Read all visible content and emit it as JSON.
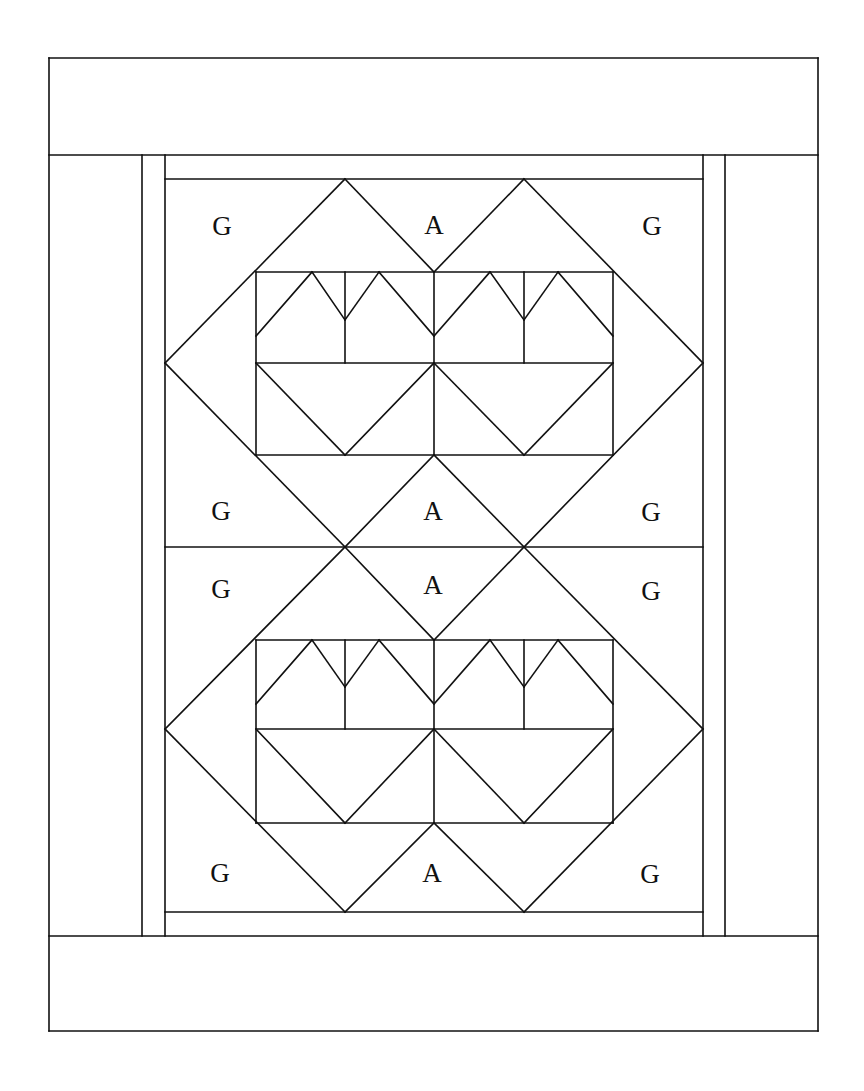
{
  "diagram": {
    "type": "quilt-block-layout",
    "stroke_color": "#111111",
    "background": "#ffffff",
    "outer_frame": {
      "x1": 49,
      "y1": 58,
      "x2": 818,
      "y2": 1031
    },
    "top_border": {
      "y": 155
    },
    "bottom_border": {
      "y": 936
    },
    "sashing": {
      "left_outer_x": 142,
      "left_inner_x": 165,
      "right_inner_x": 703,
      "right_outer_x": 725
    },
    "center_block": {
      "x1": 165,
      "y1": 179,
      "x2": 703,
      "y2": 912,
      "divider_y": 547
    },
    "hearts_blocks": [
      {
        "top": 179,
        "rect_top": 272,
        "mid": 363,
        "rect_bottom": 455,
        "bottom": 547,
        "v_bottom": 320,
        "inner_v": 336
      },
      {
        "top": 547,
        "rect_top": 640,
        "mid": 729,
        "rect_bottom": 823,
        "bottom": 912,
        "v_bottom": 687,
        "inner_v": 704
      }
    ],
    "columns": {
      "left": 165,
      "rect_left": 256,
      "peak_l1": 312,
      "heart1_center": 345,
      "peak_l2": 379,
      "center": 434,
      "peak_r1": 490,
      "heart2_center": 524,
      "peak_r2": 558,
      "rect_right": 613,
      "right": 703
    },
    "labels": [
      {
        "text": "G",
        "x": 222,
        "y": 226
      },
      {
        "text": "A",
        "x": 434,
        "y": 225
      },
      {
        "text": "G",
        "x": 652,
        "y": 226
      },
      {
        "text": "G",
        "x": 221,
        "y": 511
      },
      {
        "text": "A",
        "x": 433,
        "y": 511
      },
      {
        "text": "G",
        "x": 651,
        "y": 512
      },
      {
        "text": "G",
        "x": 221,
        "y": 589
      },
      {
        "text": "A",
        "x": 433,
        "y": 585
      },
      {
        "text": "G",
        "x": 651,
        "y": 591
      },
      {
        "text": "G",
        "x": 220,
        "y": 873
      },
      {
        "text": "A",
        "x": 432,
        "y": 873
      },
      {
        "text": "G",
        "x": 650,
        "y": 874
      }
    ]
  }
}
